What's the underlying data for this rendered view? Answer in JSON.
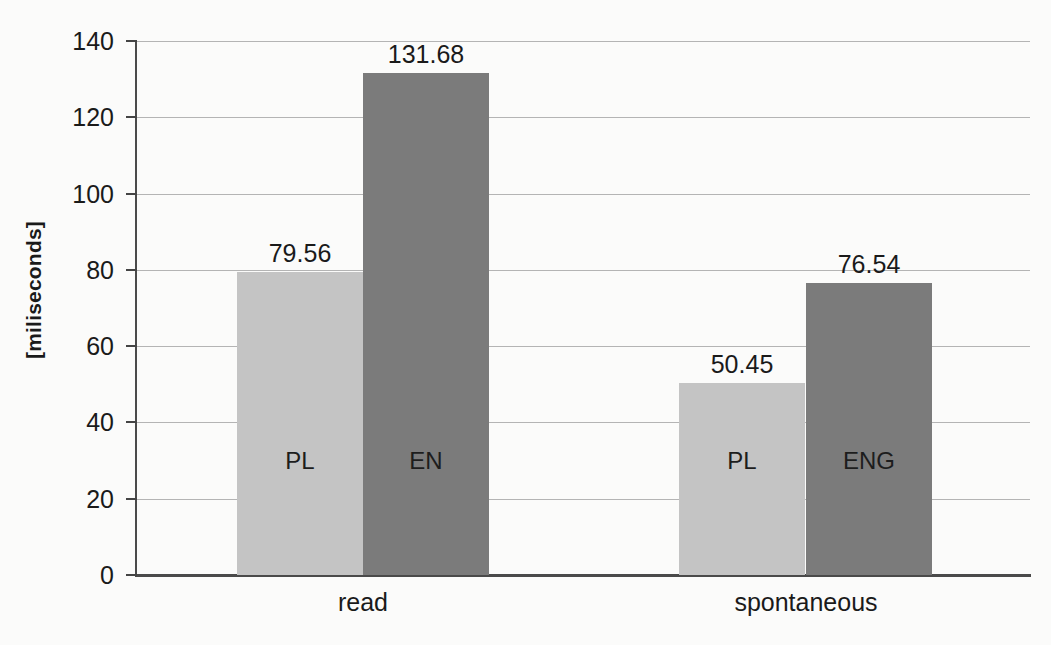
{
  "chart_data": {
    "type": "bar",
    "title": "",
    "subtitle": "",
    "xlabel": "",
    "ylabel": "[miliseconds]",
    "ylim": [
      0,
      140
    ],
    "ytick_values": [
      0,
      20,
      40,
      60,
      80,
      100,
      120,
      140
    ],
    "ytick_labels": [
      "0",
      "20",
      "40",
      "60",
      "80",
      "100",
      "120",
      "140"
    ],
    "grid": true,
    "legend": "none",
    "categories": [
      "read",
      "spontaneous"
    ],
    "series": [
      {
        "name": "PL",
        "color": "#c4c4c4",
        "values": [
          79.56,
          50.45
        ],
        "value_labels": [
          "79.56",
          "50.45"
        ],
        "bar_labels": [
          "PL",
          "PL"
        ]
      },
      {
        "name": "EN",
        "color": "#7b7b7b",
        "values": [
          131.68,
          76.54
        ],
        "value_labels": [
          "131.68",
          "76.54"
        ],
        "bar_labels": [
          "EN",
          "ENG"
        ]
      }
    ],
    "bars": [
      {
        "group": "read",
        "series": "PL",
        "label_in_bar": "PL",
        "value": 79.56,
        "value_label": "79.56",
        "color": "#c4c4c4"
      },
      {
        "group": "read",
        "series": "EN",
        "label_in_bar": "EN",
        "value": 131.68,
        "value_label": "131.68",
        "color": "#7b7b7b"
      },
      {
        "group": "spontaneous",
        "series": "PL",
        "label_in_bar": "PL",
        "value": 50.45,
        "value_label": "50.45",
        "color": "#c4c4c4"
      },
      {
        "group": "spontaneous",
        "series": "EN",
        "label_in_bar": "ENG",
        "value": 76.54,
        "value_label": "76.54",
        "color": "#7b7b7b"
      }
    ],
    "colors": {
      "background": "#fbfbfa",
      "gridline": "#b4b4b4",
      "axis": "#4a4a4a",
      "text": "#1a1a1a",
      "bar_light": "#c4c4c4",
      "bar_dark": "#7b7b7b"
    }
  }
}
